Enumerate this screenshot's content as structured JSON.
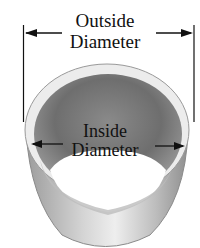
{
  "diagram": {
    "outside_label": {
      "line1": "Outside",
      "line2": "Diameter"
    },
    "inside_label": {
      "line1": "Inside",
      "line2": "Diameter"
    },
    "colors": {
      "background": "#ffffff",
      "text": "#111111",
      "inner_dark": "#6b6b6b",
      "outer_light": "#d8d8d8",
      "rim": "#f2f2f2"
    }
  }
}
